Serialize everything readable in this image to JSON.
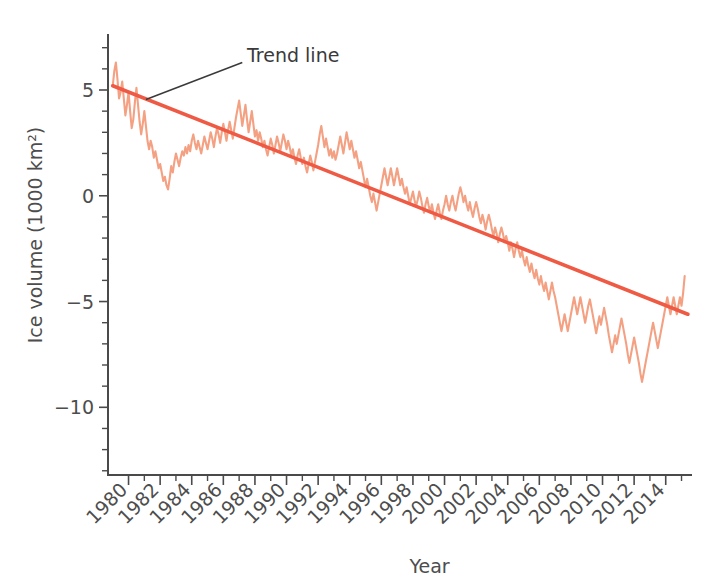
{
  "chart_data": {
    "type": "line",
    "title": "",
    "xlabel": "Year",
    "ylabel": "Ice volume (1000 km²)",
    "xlim": [
      1978.7,
      2015.6
    ],
    "ylim": [
      -13.2,
      7.6
    ],
    "grid": false,
    "legend_position": "none",
    "colors": {
      "series": "#f4a183",
      "trend": "#ef5a45",
      "axis": "#4a4a4a",
      "text": "#4d4d4d",
      "annotation": "#3a3a3a"
    },
    "x_ticks_major": [
      1980,
      1982,
      1984,
      1986,
      1988,
      1990,
      1992,
      1994,
      1996,
      1998,
      2000,
      2002,
      2004,
      2006,
      2008,
      2010,
      2012,
      2014
    ],
    "x_tick_labels": [
      "1980",
      "1982",
      "1984",
      "1986",
      "1988",
      "1990",
      "1992",
      "1994",
      "1996",
      "1998",
      "2000",
      "2002",
      "2004",
      "2006",
      "2008",
      "2010",
      "2012",
      "2014"
    ],
    "x_ticks_minor": [
      1981,
      1983,
      1985,
      1987,
      1989,
      1991,
      1993,
      1995,
      1997,
      1999,
      2001,
      2003,
      2005,
      2007,
      2009,
      2011,
      2013,
      2015
    ],
    "y_ticks_major": [
      5,
      0,
      -5,
      -10
    ],
    "y_tick_labels": [
      "5",
      "0",
      "−5",
      "−10"
    ],
    "y_ticks_minor": [
      7,
      6,
      4,
      3,
      2,
      1,
      -1,
      -2,
      -3,
      -4,
      -6,
      -7,
      -8,
      -9,
      -11,
      -12,
      -13
    ],
    "annotations": [
      {
        "label": "Trend line",
        "text_x": 1987.5,
        "text_y": 6.6,
        "leader_from_x": 1987.2,
        "leader_from_y": 6.3,
        "leader_to_x": 1981.1,
        "leader_to_y": 4.55
      }
    ],
    "series": [
      {
        "name": "Arctic sea ice volume anomaly",
        "x": [
          1979.0,
          1979.1,
          1979.2,
          1979.3,
          1979.4,
          1979.5,
          1979.6,
          1979.7,
          1979.8,
          1979.9,
          1980.0,
          1980.1,
          1980.2,
          1980.3,
          1980.4,
          1980.5,
          1980.6,
          1980.7,
          1980.8,
          1980.9,
          1981.0,
          1981.1,
          1981.2,
          1981.3,
          1981.4,
          1981.5,
          1981.6,
          1981.7,
          1981.8,
          1981.9,
          1982.0,
          1982.1,
          1982.2,
          1982.3,
          1982.4,
          1982.5,
          1982.6,
          1982.7,
          1982.8,
          1982.9,
          1983.0,
          1983.1,
          1983.2,
          1983.3,
          1983.4,
          1983.5,
          1983.6,
          1983.7,
          1983.8,
          1983.9,
          1984.0,
          1984.1,
          1984.2,
          1984.3,
          1984.4,
          1984.5,
          1984.6,
          1984.7,
          1984.8,
          1984.9,
          1985.0,
          1985.1,
          1985.2,
          1985.3,
          1985.4,
          1985.5,
          1985.6,
          1985.7,
          1985.8,
          1985.9,
          1986.0,
          1986.1,
          1986.2,
          1986.3,
          1986.4,
          1986.5,
          1986.6,
          1986.7,
          1986.8,
          1986.9,
          1987.0,
          1987.1,
          1987.2,
          1987.3,
          1987.4,
          1987.5,
          1987.6,
          1987.7,
          1987.8,
          1987.9,
          1988.0,
          1988.1,
          1988.2,
          1988.3,
          1988.4,
          1988.5,
          1988.6,
          1988.7,
          1988.8,
          1988.9,
          1989.0,
          1989.1,
          1989.2,
          1989.3,
          1989.4,
          1989.5,
          1989.6,
          1989.7,
          1989.8,
          1989.9,
          1990.0,
          1990.1,
          1990.2,
          1990.3,
          1990.4,
          1990.5,
          1990.6,
          1990.7,
          1990.8,
          1990.9,
          1991.0,
          1991.1,
          1991.2,
          1991.3,
          1991.4,
          1991.5,
          1991.6,
          1991.7,
          1991.8,
          1991.9,
          1992.0,
          1992.1,
          1992.2,
          1992.3,
          1992.4,
          1992.5,
          1992.6,
          1992.7,
          1992.8,
          1992.9,
          1993.0,
          1993.1,
          1993.2,
          1993.3,
          1993.4,
          1993.5,
          1993.6,
          1993.7,
          1993.8,
          1993.9,
          1994.0,
          1994.1,
          1994.2,
          1994.3,
          1994.4,
          1994.5,
          1994.6,
          1994.7,
          1994.8,
          1994.9,
          1995.0,
          1995.1,
          1995.2,
          1995.3,
          1995.4,
          1995.5,
          1995.6,
          1995.7,
          1995.8,
          1995.9,
          1996.0,
          1996.1,
          1996.2,
          1996.3,
          1996.4,
          1996.5,
          1996.6,
          1996.7,
          1996.8,
          1996.9,
          1997.0,
          1997.1,
          1997.2,
          1997.3,
          1997.4,
          1997.5,
          1997.6,
          1997.7,
          1997.8,
          1997.9,
          1998.0,
          1998.1,
          1998.2,
          1998.3,
          1998.4,
          1998.5,
          1998.6,
          1998.7,
          1998.8,
          1998.9,
          1999.0,
          1999.1,
          1999.2,
          1999.3,
          1999.4,
          1999.5,
          1999.6,
          1999.7,
          1999.8,
          1999.9,
          2000.0,
          2000.1,
          2000.2,
          2000.3,
          2000.4,
          2000.5,
          2000.6,
          2000.7,
          2000.8,
          2000.9,
          2001.0,
          2001.1,
          2001.2,
          2001.3,
          2001.4,
          2001.5,
          2001.6,
          2001.7,
          2001.8,
          2001.9,
          2002.0,
          2002.1,
          2002.2,
          2002.3,
          2002.4,
          2002.5,
          2002.6,
          2002.7,
          2002.8,
          2002.9,
          2003.0,
          2003.1,
          2003.2,
          2003.3,
          2003.4,
          2003.5,
          2003.6,
          2003.7,
          2003.8,
          2003.9,
          2004.0,
          2004.1,
          2004.2,
          2004.3,
          2004.4,
          2004.5,
          2004.6,
          2004.7,
          2004.8,
          2004.9,
          2005.0,
          2005.1,
          2005.2,
          2005.3,
          2005.4,
          2005.5,
          2005.6,
          2005.7,
          2005.8,
          2005.9,
          2006.0,
          2006.1,
          2006.2,
          2006.3,
          2006.4,
          2006.5,
          2006.6,
          2006.7,
          2006.8,
          2006.9,
          2007.0,
          2007.1,
          2007.2,
          2007.3,
          2007.4,
          2007.5,
          2007.6,
          2007.7,
          2007.8,
          2007.9,
          2008.0,
          2008.1,
          2008.2,
          2008.3,
          2008.4,
          2008.5,
          2008.6,
          2008.7,
          2008.8,
          2008.9,
          2009.0,
          2009.1,
          2009.2,
          2009.3,
          2009.4,
          2009.5,
          2009.6,
          2009.7,
          2009.8,
          2009.9,
          2010.0,
          2010.1,
          2010.2,
          2010.3,
          2010.4,
          2010.5,
          2010.6,
          2010.7,
          2010.8,
          2010.9,
          2011.0,
          2011.1,
          2011.2,
          2011.3,
          2011.4,
          2011.5,
          2011.6,
          2011.7,
          2011.8,
          2011.9,
          2012.0,
          2012.1,
          2012.2,
          2012.3,
          2012.4,
          2012.5,
          2012.6,
          2012.7,
          2012.8,
          2012.9,
          2013.0,
          2013.1,
          2013.2,
          2013.3,
          2013.4,
          2013.5,
          2013.6,
          2013.7,
          2013.8,
          2013.9,
          2014.0,
          2014.1,
          2014.2,
          2014.3,
          2014.4,
          2014.5,
          2014.6,
          2014.7,
          2014.8,
          2014.9,
          2015.0,
          2015.1,
          2015.2
        ],
        "y": [
          5.2,
          5.9,
          6.3,
          5.5,
          4.6,
          4.9,
          5.4,
          4.6,
          3.8,
          4.3,
          4.9,
          4.0,
          3.2,
          3.6,
          4.4,
          5.1,
          4.3,
          3.5,
          2.9,
          3.4,
          4.0,
          3.3,
          2.6,
          2.2,
          2.6,
          2.3,
          1.8,
          2.1,
          1.7,
          1.3,
          1.5,
          1.1,
          0.7,
          0.9,
          0.5,
          0.3,
          0.8,
          1.4,
          1.1,
          1.6,
          2.0,
          1.7,
          1.4,
          1.8,
          2.1,
          1.9,
          2.3,
          2.0,
          2.4,
          2.1,
          2.6,
          2.9,
          2.5,
          2.2,
          2.6,
          2.3,
          2.0,
          2.4,
          2.8,
          2.5,
          2.2,
          2.6,
          3.0,
          2.7,
          2.3,
          2.8,
          3.2,
          2.9,
          2.5,
          3.0,
          3.4,
          3.0,
          2.6,
          3.1,
          3.5,
          3.1,
          2.7,
          3.2,
          3.7,
          4.1,
          4.5,
          3.9,
          3.3,
          3.8,
          4.3,
          3.6,
          3.0,
          3.5,
          4.0,
          3.4,
          2.8,
          3.1,
          2.6,
          3.0,
          2.7,
          2.3,
          2.6,
          2.2,
          1.9,
          2.3,
          2.7,
          2.4,
          2.0,
          2.4,
          2.8,
          2.5,
          2.1,
          2.5,
          2.9,
          2.6,
          2.2,
          2.6,
          2.3,
          1.9,
          2.2,
          1.8,
          1.5,
          1.9,
          2.2,
          1.8,
          1.5,
          1.8,
          1.4,
          1.1,
          1.5,
          1.9,
          1.6,
          1.2,
          1.6,
          2.0,
          2.4,
          2.9,
          3.3,
          2.8,
          2.3,
          2.7,
          2.3,
          1.9,
          2.2,
          1.8,
          2.1,
          1.7,
          2.0,
          2.4,
          2.8,
          2.4,
          2.0,
          2.5,
          3.0,
          2.6,
          2.2,
          2.6,
          2.2,
          1.8,
          2.1,
          1.7,
          1.3,
          1.6,
          1.2,
          0.8,
          0.4,
          0.8,
          0.4,
          0.0,
          -0.3,
          0.1,
          -0.3,
          -0.7,
          -0.3,
          0.1,
          0.5,
          0.9,
          1.3,
          0.9,
          0.5,
          0.9,
          1.3,
          0.9,
          0.5,
          0.9,
          1.3,
          0.9,
          0.5,
          0.8,
          0.4,
          0.1,
          0.4,
          0.0,
          -0.4,
          -0.1,
          0.2,
          -0.2,
          -0.5,
          -0.2,
          0.2,
          -0.1,
          -0.5,
          -0.8,
          -0.4,
          -0.1,
          -0.5,
          -0.8,
          -0.4,
          -0.8,
          -1.1,
          -0.7,
          -0.4,
          -0.8,
          -1.1,
          -0.7,
          -0.4,
          0.0,
          -0.4,
          -0.7,
          -0.3,
          0.0,
          -0.4,
          -0.7,
          -0.3,
          0.1,
          0.4,
          0.1,
          -0.3,
          0.0,
          -0.4,
          -0.7,
          -0.3,
          -0.7,
          -1.0,
          -0.6,
          -0.3,
          -0.6,
          -1.0,
          -1.3,
          -0.9,
          -1.2,
          -1.6,
          -1.2,
          -0.9,
          -1.2,
          -1.6,
          -1.9,
          -1.5,
          -1.8,
          -2.2,
          -1.8,
          -1.5,
          -1.8,
          -2.2,
          -1.9,
          -2.2,
          -2.6,
          -2.2,
          -2.5,
          -2.9,
          -2.5,
          -2.2,
          -2.6,
          -2.9,
          -2.6,
          -3.0,
          -3.3,
          -2.9,
          -3.3,
          -3.6,
          -3.2,
          -3.6,
          -3.9,
          -3.5,
          -3.9,
          -4.2,
          -3.8,
          -4.2,
          -4.5,
          -4.1,
          -4.5,
          -4.9,
          -4.5,
          -4.1,
          -4.5,
          -4.8,
          -5.2,
          -5.6,
          -6.0,
          -6.4,
          -6.0,
          -5.6,
          -6.0,
          -6.4,
          -6.0,
          -5.6,
          -5.2,
          -4.8,
          -5.2,
          -5.6,
          -5.2,
          -4.8,
          -5.2,
          -5.6,
          -6.0,
          -5.6,
          -5.2,
          -4.9,
          -5.3,
          -5.7,
          -6.1,
          -6.5,
          -6.1,
          -5.7,
          -6.1,
          -5.7,
          -5.3,
          -5.7,
          -6.1,
          -6.6,
          -7.0,
          -7.4,
          -7.0,
          -6.6,
          -7.0,
          -6.6,
          -6.2,
          -5.8,
          -6.2,
          -6.6,
          -7.0,
          -7.5,
          -7.9,
          -7.5,
          -7.1,
          -6.7,
          -7.1,
          -7.5,
          -7.9,
          -8.4,
          -8.8,
          -8.4,
          -8.0,
          -7.6,
          -7.2,
          -6.8,
          -6.4,
          -6.0,
          -6.4,
          -6.8,
          -7.2,
          -6.8,
          -6.4,
          -6.0,
          -5.6,
          -5.2,
          -4.8,
          -5.2,
          -5.6,
          -5.2,
          -4.8,
          -5.2,
          -5.6,
          -5.2,
          -4.8,
          -5.2,
          -4.6,
          -3.8
        ]
      }
    ],
    "trend": {
      "name": "Trend line",
      "x_start": 1979.0,
      "y_start": 5.2,
      "x_end": 2015.4,
      "y_end": -5.6
    }
  }
}
